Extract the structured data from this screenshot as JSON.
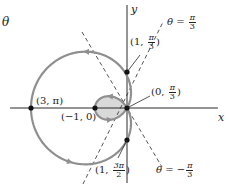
{
  "figure": {
    "title_symbol": "θ",
    "axes": {
      "x_label": "x",
      "y_label": "y"
    },
    "colors": {
      "curve": "#8f8f8f",
      "shading": "#d9d9d9",
      "axis": "#2a2a2a",
      "dashed": "#2a2a2a",
      "point": "#111111",
      "text": "#222222"
    },
    "curve": {
      "equation": "r = 1 - 2cos θ",
      "origin_px": [
        127,
        108
      ],
      "scale_px_per_unit": 32
    },
    "points": [
      {
        "name": "point-3-pi",
        "label": "(3, π)",
        "px": [
          31,
          108
        ]
      },
      {
        "name": "point-neg1-0",
        "label": "(−1, 0)",
        "px": [
          95,
          108
        ]
      },
      {
        "name": "point-1-pi3",
        "label_a": "(1, ",
        "num": "π",
        "den": "3",
        "label_b": ")",
        "px": [
          127,
          72
        ]
      },
      {
        "name": "point-0-pi3",
        "label_a": "(0, ",
        "num": "π",
        "den": "3",
        "label_b": ")",
        "px": [
          127,
          108
        ]
      },
      {
        "name": "point-1-3pi2",
        "label_a": "(1, ",
        "num": "3π",
        "den": "2",
        "label_b": ")",
        "px": [
          127,
          140
        ]
      }
    ],
    "lines": [
      {
        "name": "theta-pi-over-3",
        "label_a": "θ = ",
        "num": "π",
        "den": "3"
      },
      {
        "name": "theta-neg-pi-over-3",
        "label_a": "θ = −",
        "num": "π",
        "den": "3"
      }
    ]
  }
}
